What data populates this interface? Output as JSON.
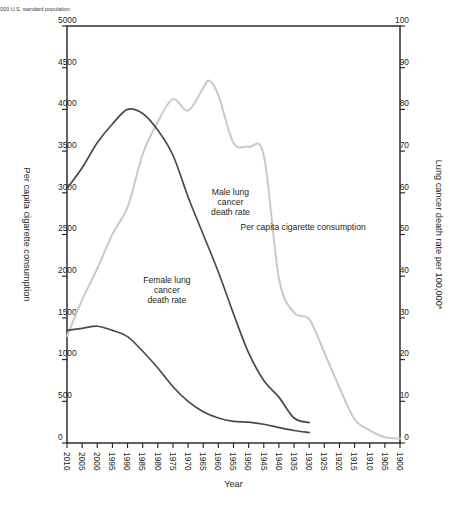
{
  "figure": {
    "footnote": "*Age-adjusted to 2000 U.S. standard population",
    "background": "#ffffff"
  },
  "chart_data": {
    "type": "line",
    "title": "",
    "xlabel": "Year",
    "ylabel": "Lung cancer death rate per 100,000*",
    "y2label": "Per capita cigarette consumption",
    "xlim": [
      1900,
      2010
    ],
    "ylim": [
      0,
      100
    ],
    "y2lim": [
      0,
      5000
    ],
    "grid": false,
    "legend": "inline-annotations",
    "xticks": [
      1900,
      1905,
      1910,
      1915,
      1920,
      1925,
      1930,
      1935,
      1940,
      1945,
      1950,
      1955,
      1960,
      1965,
      1970,
      1975,
      1980,
      1985,
      1990,
      1995,
      2000,
      2005,
      2010
    ],
    "yticks": [
      0,
      10,
      20,
      30,
      40,
      50,
      60,
      70,
      80,
      90,
      100
    ],
    "y2ticks": [
      0,
      500,
      1000,
      1500,
      2000,
      2500,
      3000,
      3500,
      4000,
      4500,
      5000
    ],
    "colors": {
      "male": "#4a4a4a",
      "female": "#4a4a4a",
      "cigarette": "#c9c9c9",
      "axis": "#231f20"
    },
    "annotations": [
      {
        "name": "female-lung-cancer-death-rate",
        "text": "Female lung cancer death rate",
        "x": 1977,
        "y": 36
      },
      {
        "name": "male-lung-cancer-death-rate",
        "text": "Male lung cancer death rate",
        "x": 1956,
        "y": 57
      },
      {
        "name": "per-capita-cigarette-consumption",
        "text": "Per capita cigarette consumption",
        "x": 1932,
        "y": 51
      }
    ],
    "series": [
      {
        "name": "Per capita cigarette consumption",
        "axis": "y2",
        "x": [
          1900,
          1905,
          1910,
          1915,
          1920,
          1925,
          1930,
          1935,
          1940,
          1945,
          1950,
          1955,
          1960,
          1963,
          1965,
          1970,
          1975,
          1980,
          1985,
          1990,
          1995,
          2000,
          2005,
          2010
        ],
        "values": [
          54,
          70,
          151,
          285,
          665,
          1085,
          1485,
          1564,
          1976,
          3449,
          3552,
          3597,
          4171,
          4345,
          4258,
          3985,
          4123,
          3851,
          3461,
          2827,
          2505,
          2092,
          1716,
          1281
        ]
      },
      {
        "name": "Male lung cancer death rate",
        "axis": "y1",
        "x": [
          1930,
          1935,
          1940,
          1945,
          1950,
          1955,
          1960,
          1965,
          1970,
          1975,
          1980,
          1985,
          1990,
          1995,
          2000,
          2005,
          2010
        ],
        "values": [
          4.9,
          6.0,
          11.0,
          15.0,
          21.6,
          31.0,
          41.0,
          50.0,
          59.0,
          69.0,
          75.0,
          79.0,
          80.0,
          76.5,
          72.0,
          66.0,
          61.0
        ]
      },
      {
        "name": "Female lung cancer death rate",
        "axis": "y1",
        "x": [
          1930,
          1935,
          1940,
          1945,
          1950,
          1955,
          1960,
          1965,
          1970,
          1975,
          1980,
          1985,
          1990,
          1995,
          2000,
          2005,
          2010
        ],
        "values": [
          2.5,
          3.0,
          3.7,
          4.5,
          5.0,
          5.2,
          6.0,
          7.5,
          10.0,
          13.5,
          18.0,
          22.0,
          25.5,
          27.0,
          28.0,
          27.5,
          27.0
        ]
      }
    ]
  }
}
